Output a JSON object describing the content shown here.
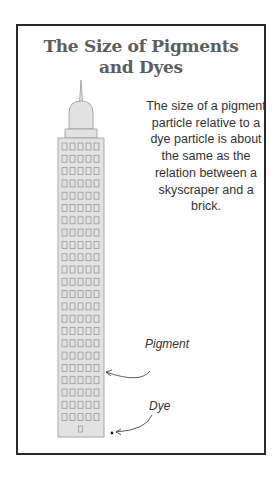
{
  "title": {
    "line1": "The Size of Pigments",
    "line2": "and Dyes"
  },
  "description": "The size of a pigment particle relative to a dye particle is about the same as the relation between a skyscraper and a brick.",
  "labels": {
    "pigment": "Pigment",
    "dye": "Dye"
  },
  "colors": {
    "border": "#2a2a2a",
    "building_fill": "#e2e2e2",
    "building_stroke": "#9a9a9a",
    "title": "#5d5d5d"
  },
  "icons": {
    "skyscraper": "skyscraper-icon",
    "dye_particle": "dot-icon"
  }
}
